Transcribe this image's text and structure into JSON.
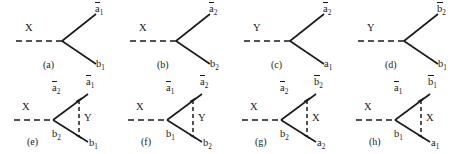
{
  "figure": {
    "type": "feynman-diagram-set",
    "background_color": "#ffffff",
    "line_color": "#1a1a1a",
    "panel_count": 8,
    "rows": 2,
    "columns": 4
  },
  "diagrams": [
    {
      "id": "a",
      "caption": "(a)",
      "topology": "two-body-decay",
      "incoming": {
        "label": "X",
        "bar": false,
        "sub": "",
        "style": "dashed"
      },
      "outgoing_upper": {
        "label": "a",
        "bar": true,
        "sub": "1",
        "style": "solid"
      },
      "outgoing_lower": {
        "label": "b",
        "bar": false,
        "sub": "1",
        "style": "solid"
      },
      "internal": null
    },
    {
      "id": "b",
      "caption": "(b)",
      "topology": "two-body-decay",
      "incoming": {
        "label": "X",
        "bar": false,
        "sub": "",
        "style": "dashed"
      },
      "outgoing_upper": {
        "label": "a",
        "bar": true,
        "sub": "2",
        "style": "solid"
      },
      "outgoing_lower": {
        "label": "b",
        "bar": false,
        "sub": "2",
        "style": "solid"
      },
      "internal": null
    },
    {
      "id": "c",
      "caption": "(c)",
      "topology": "two-body-decay",
      "incoming": {
        "label": "Y",
        "bar": false,
        "sub": "",
        "style": "dashed"
      },
      "outgoing_upper": {
        "label": "a",
        "bar": true,
        "sub": "2",
        "style": "solid"
      },
      "outgoing_lower": {
        "label": "a",
        "bar": false,
        "sub": "1",
        "style": "solid"
      },
      "internal": null
    },
    {
      "id": "d",
      "caption": "(d)",
      "topology": "two-body-decay",
      "incoming": {
        "label": "Y",
        "bar": false,
        "sub": "",
        "style": "dashed"
      },
      "outgoing_upper": {
        "label": "b",
        "bar": true,
        "sub": "2",
        "style": "solid"
      },
      "outgoing_lower": {
        "label": "b",
        "bar": false,
        "sub": "1",
        "style": "solid"
      },
      "internal": null
    },
    {
      "id": "e",
      "caption": "(e)",
      "topology": "triangle-loop",
      "incoming": {
        "label": "X",
        "bar": false,
        "sub": "",
        "style": "dashed"
      },
      "inner_upper": {
        "label": "a",
        "bar": true,
        "sub": "2",
        "style": "solid"
      },
      "inner_lower": {
        "label": "b",
        "bar": false,
        "sub": "2",
        "style": "solid"
      },
      "outgoing_upper": {
        "label": "a",
        "bar": true,
        "sub": "1",
        "style": "solid"
      },
      "outgoing_lower": {
        "label": "b",
        "bar": false,
        "sub": "1",
        "style": "solid"
      },
      "internal": {
        "label": "Y",
        "bar": false,
        "sub": "",
        "style": "dashed"
      }
    },
    {
      "id": "f",
      "caption": "(f)",
      "topology": "triangle-loop",
      "incoming": {
        "label": "X",
        "bar": false,
        "sub": "",
        "style": "dashed"
      },
      "inner_upper": {
        "label": "a",
        "bar": true,
        "sub": "1",
        "style": "solid"
      },
      "inner_lower": {
        "label": "b",
        "bar": false,
        "sub": "1",
        "style": "solid"
      },
      "outgoing_upper": {
        "label": "a",
        "bar": true,
        "sub": "2",
        "style": "solid"
      },
      "outgoing_lower": {
        "label": "b",
        "bar": false,
        "sub": "2",
        "style": "solid"
      },
      "internal": {
        "label": "Y",
        "bar": false,
        "sub": "",
        "style": "dashed"
      }
    },
    {
      "id": "g",
      "caption": "(g)",
      "topology": "triangle-loop",
      "incoming": {
        "label": "X",
        "bar": false,
        "sub": "",
        "style": "dashed"
      },
      "inner_upper": {
        "label": "a",
        "bar": true,
        "sub": "2",
        "style": "solid"
      },
      "inner_lower": {
        "label": "b",
        "bar": false,
        "sub": "2",
        "style": "solid"
      },
      "outgoing_upper": {
        "label": "b",
        "bar": true,
        "sub": "2",
        "style": "solid"
      },
      "outgoing_lower": {
        "label": "a",
        "bar": false,
        "sub": "2",
        "style": "solid"
      },
      "internal": {
        "label": "X",
        "bar": false,
        "sub": "",
        "style": "dashed"
      }
    },
    {
      "id": "h",
      "caption": "(h)",
      "topology": "triangle-loop",
      "incoming": {
        "label": "X",
        "bar": false,
        "sub": "",
        "style": "dashed"
      },
      "inner_upper": {
        "label": "a",
        "bar": true,
        "sub": "1",
        "style": "solid"
      },
      "inner_lower": {
        "label": "b",
        "bar": false,
        "sub": "1",
        "style": "solid"
      },
      "outgoing_upper": {
        "label": "b",
        "bar": true,
        "sub": "1",
        "style": "solid"
      },
      "outgoing_lower": {
        "label": "a",
        "bar": false,
        "sub": "1",
        "style": "solid"
      },
      "internal": {
        "label": "X",
        "bar": false,
        "sub": "",
        "style": "dashed"
      }
    }
  ]
}
